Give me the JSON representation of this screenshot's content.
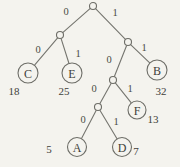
{
  "diagram": {
    "type": "binary-tree",
    "colors": {
      "background": "#f4f3ee",
      "line": "#75756f",
      "node_stroke": "#6d6d67",
      "text": "#3f3f3a",
      "bit_text": "#4a4a44"
    },
    "nodes": [
      {
        "id": "root",
        "kind": "internal",
        "x": 93,
        "y": 6,
        "r": 3.5
      },
      {
        "id": "n-left",
        "kind": "internal",
        "x": 60,
        "y": 35,
        "r": 3.5
      },
      {
        "id": "n-right",
        "kind": "internal",
        "x": 128,
        "y": 42,
        "r": 3.5
      },
      {
        "id": "n-right-left",
        "kind": "internal",
        "x": 113,
        "y": 80,
        "r": 3.5
      },
      {
        "id": "n-bottom",
        "kind": "internal",
        "x": 98,
        "y": 107,
        "r": 3.5
      },
      {
        "id": "C",
        "kind": "leaf",
        "letter": "C",
        "x": 28,
        "y": 73,
        "r": 10,
        "value": "18",
        "value_x": 14,
        "value_y": 91
      },
      {
        "id": "E",
        "kind": "leaf",
        "letter": "E",
        "x": 72,
        "y": 73,
        "r": 10,
        "value": "25",
        "value_x": 64,
        "value_y": 91
      },
      {
        "id": "B",
        "kind": "leaf",
        "letter": "B",
        "x": 157,
        "y": 70,
        "r": 10,
        "value": "32",
        "value_x": 161,
        "value_y": 91
      },
      {
        "id": "F",
        "kind": "leaf",
        "letter": "F",
        "x": 137,
        "y": 110,
        "r": 9,
        "value": "13",
        "value_x": 153,
        "value_y": 119
      },
      {
        "id": "A",
        "kind": "leaf",
        "letter": "A",
        "x": 77,
        "y": 147,
        "r": 9.5,
        "value": "5",
        "value_x": 49,
        "value_y": 149
      },
      {
        "id": "D",
        "kind": "leaf",
        "letter": "D",
        "x": 122,
        "y": 147,
        "r": 9.5,
        "value": "7",
        "value_x": 136,
        "value_y": 151
      }
    ],
    "edges": [
      {
        "from": "root",
        "to": "n-left",
        "bit": "0",
        "bit_x": 66,
        "bit_y": 11
      },
      {
        "from": "root",
        "to": "n-right",
        "bit": "1",
        "bit_x": 115,
        "bit_y": 12
      },
      {
        "from": "n-left",
        "to": "C",
        "bit": "0",
        "bit_x": 38,
        "bit_y": 49
      },
      {
        "from": "n-left",
        "to": "E",
        "bit": "1",
        "bit_x": 78,
        "bit_y": 53
      },
      {
        "from": "n-right",
        "to": "n-right-left",
        "bit": "0",
        "bit_x": 109,
        "bit_y": 59
      },
      {
        "from": "n-right",
        "to": "B",
        "bit": "1",
        "bit_x": 144,
        "bit_y": 47
      },
      {
        "from": "n-right-left",
        "to": "n-bottom",
        "bit": "0",
        "bit_x": 94,
        "bit_y": 88
      },
      {
        "from": "n-right-left",
        "to": "F",
        "bit": "1",
        "bit_x": 130,
        "bit_y": 88
      },
      {
        "from": "n-bottom",
        "to": "A",
        "bit": "0",
        "bit_x": 83,
        "bit_y": 119
      },
      {
        "from": "n-bottom",
        "to": "D",
        "bit": "1",
        "bit_x": 116,
        "bit_y": 121
      }
    ]
  }
}
